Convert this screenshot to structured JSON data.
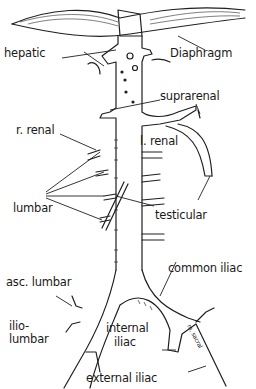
{
  "figure": {
    "labels": {
      "hepatic": "hepatic",
      "diaphragm": "Diaphragm",
      "suprarenal": "suprarenal",
      "r_renal": "r. renal",
      "l_renal": "l. renal",
      "lumbar": "lumbar",
      "testicular": "testicular",
      "common_iliac": "common iliac",
      "asc_lumbar": "asc. lumbar",
      "ilio_lumbar_1": "ilio-",
      "ilio_lumbar_2": "lumbar",
      "internal_iliac_1": "internal",
      "internal_iliac_2": "iliac",
      "external_iliac": "external iliac",
      "median_sacral": "m. sacral"
    },
    "colors": {
      "ink": "#1f1f1f",
      "background": "#ffffff"
    }
  }
}
